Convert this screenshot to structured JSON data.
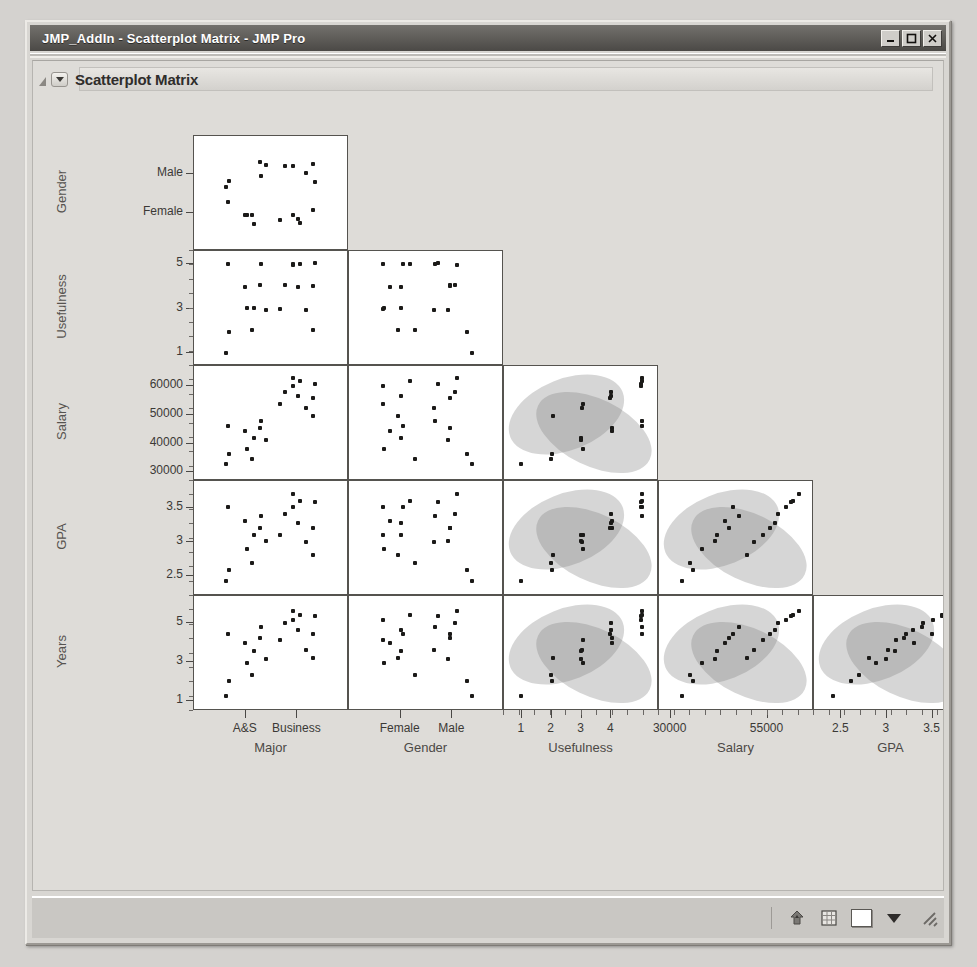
{
  "window": {
    "title": "JMP_AddIn - Scatterplot Matrix - JMP Pro",
    "controls": {
      "minimize": "minimize-icon",
      "maximize": "maximize-icon",
      "close": "close-icon"
    }
  },
  "panel": {
    "title": "Scatterplot Matrix",
    "disclosure": "disclosure-triangle-icon",
    "popup_menu": "red-triangle-popup-icon"
  },
  "statusbar": {
    "home_icon": "home-up-arrow-icon",
    "grid_icon": "data-table-icon",
    "color_swatch": "#ffffff",
    "dropdown": "chevron-down-icon",
    "resize_grip": "resize-grip-icon"
  },
  "chart_data": {
    "type": "scatter",
    "title": "Scatterplot Matrix",
    "layout": "lower-triangular scatterplot matrix",
    "grid": false,
    "legend": "none",
    "annotations": "95% bivariate normal density ellipses shown as shaded gray regions on continuous-vs-continuous cells",
    "row_variables": [
      "Gender",
      "Usefulness",
      "Salary",
      "GPA",
      "Years"
    ],
    "column_variables": [
      "Major",
      "Gender",
      "Usefulness",
      "Salary",
      "GPA"
    ],
    "axes": {
      "Major": {
        "type": "nominal",
        "ticks": [
          "A&S",
          "Business"
        ]
      },
      "Gender": {
        "type": "nominal",
        "ticks": [
          "Female",
          "Male"
        ],
        "row_ticks": [
          "Male",
          "Female"
        ]
      },
      "Usefulness": {
        "type": "continuous",
        "ticks": [
          1,
          2,
          3,
          4
        ],
        "row_ticks": [
          5,
          3,
          1
        ],
        "range": [
          0.5,
          5.5
        ]
      },
      "Salary": {
        "type": "continuous",
        "ticks": [
          30000,
          55000
        ],
        "row_ticks": [
          60000,
          50000,
          40000,
          30000
        ],
        "range": [
          27000,
          67000
        ]
      },
      "GPA": {
        "type": "continuous",
        "ticks": [
          2.5,
          3,
          3.5
        ],
        "row_ticks": [
          3.5,
          3,
          2.5
        ],
        "range": [
          2.2,
          3.9
        ]
      },
      "Years": {
        "type": "continuous",
        "row_ticks": [
          5,
          3,
          1
        ],
        "range": [
          0.5,
          6.3
        ]
      }
    },
    "observations": [
      {
        "Major": "A&S",
        "Gender": "Male",
        "Usefulness": 1,
        "Salary": 33000,
        "GPA": 2.4,
        "Years": 1.2
      },
      {
        "Major": "A&S",
        "Gender": "Male",
        "Usefulness": 2,
        "Salary": 36000,
        "GPA": 2.6,
        "Years": 2.1
      },
      {
        "Major": "A&S",
        "Gender": "Male",
        "Usefulness": 3,
        "Salary": 41000,
        "GPA": 3.0,
        "Years": 3.2
      },
      {
        "Major": "A&S",
        "Gender": "Male",
        "Usefulness": 4,
        "Salary": 45000,
        "GPA": 3.2,
        "Years": 4.3
      },
      {
        "Major": "A&S",
        "Gender": "Male",
        "Usefulness": 5,
        "Salary": 48000,
        "GPA": 3.4,
        "Years": 4.8
      },
      {
        "Major": "A&S",
        "Gender": "Female",
        "Usefulness": 2,
        "Salary": 35000,
        "GPA": 2.7,
        "Years": 2.3
      },
      {
        "Major": "A&S",
        "Gender": "Female",
        "Usefulness": 3,
        "Salary": 38000,
        "GPA": 2.9,
        "Years": 3.0
      },
      {
        "Major": "A&S",
        "Gender": "Female",
        "Usefulness": 3,
        "Salary": 42000,
        "GPA": 3.1,
        "Years": 3.5
      },
      {
        "Major": "A&S",
        "Gender": "Female",
        "Usefulness": 4,
        "Salary": 44000,
        "GPA": 3.3,
        "Years": 4.0
      },
      {
        "Major": "A&S",
        "Gender": "Female",
        "Usefulness": 5,
        "Salary": 46000,
        "GPA": 3.5,
        "Years": 4.5
      },
      {
        "Major": "Business",
        "Gender": "Male",
        "Usefulness": 3,
        "Salary": 52000,
        "GPA": 3.0,
        "Years": 3.6
      },
      {
        "Major": "Business",
        "Gender": "Male",
        "Usefulness": 4,
        "Salary": 56000,
        "GPA": 3.2,
        "Years": 4.4
      },
      {
        "Major": "Business",
        "Gender": "Male",
        "Usefulness": 4,
        "Salary": 58000,
        "GPA": 3.4,
        "Years": 5.0
      },
      {
        "Major": "Business",
        "Gender": "Male",
        "Usefulness": 5,
        "Salary": 61000,
        "GPA": 3.6,
        "Years": 5.4
      },
      {
        "Major": "Business",
        "Gender": "Male",
        "Usefulness": 5,
        "Salary": 63000,
        "GPA": 3.7,
        "Years": 5.6
      },
      {
        "Major": "Business",
        "Gender": "Female",
        "Usefulness": 2,
        "Salary": 50000,
        "GPA": 2.8,
        "Years": 3.2
      },
      {
        "Major": "Business",
        "Gender": "Female",
        "Usefulness": 3,
        "Salary": 54000,
        "GPA": 3.1,
        "Years": 4.1
      },
      {
        "Major": "Business",
        "Gender": "Female",
        "Usefulness": 4,
        "Salary": 57000,
        "GPA": 3.3,
        "Years": 4.7
      },
      {
        "Major": "Business",
        "Gender": "Female",
        "Usefulness": 5,
        "Salary": 60000,
        "GPA": 3.5,
        "Years": 5.2
      },
      {
        "Major": "Business",
        "Gender": "Female",
        "Usefulness": 5,
        "Salary": 62000,
        "GPA": 3.6,
        "Years": 5.5
      }
    ]
  }
}
